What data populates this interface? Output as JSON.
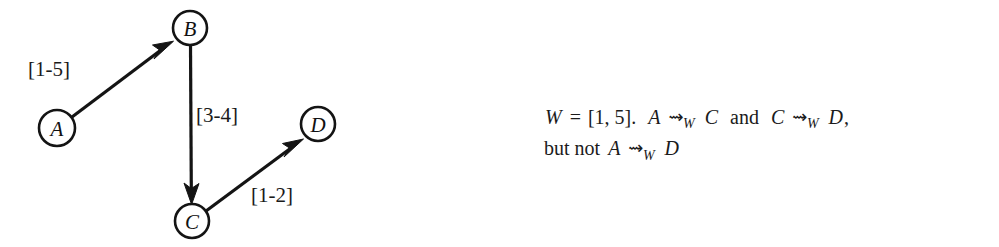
{
  "figure": {
    "background_color": "#ffffff",
    "ink_color": "#141414",
    "graph": {
      "nodes": [
        {
          "id": "A",
          "label": "A",
          "cx": 57,
          "cy": 128,
          "r": 18
        },
        {
          "id": "B",
          "label": "B",
          "cx": 190,
          "cy": 28,
          "r": 17
        },
        {
          "id": "C",
          "label": "C",
          "cx": 192,
          "cy": 221,
          "r": 17
        },
        {
          "id": "D",
          "label": "D",
          "cx": 318,
          "cy": 124,
          "r": 17
        }
      ],
      "edges": [
        {
          "id": "A-B",
          "from": "A",
          "to": "B",
          "label": "[1-5]",
          "label_x": 28,
          "label_y": 57
        },
        {
          "id": "B-C",
          "from": "B",
          "to": "C",
          "label": "[3-4]",
          "label_x": 193,
          "label_y": 103
        },
        {
          "id": "C-D",
          "from": "C",
          "to": "D",
          "label": "[1-2]",
          "label_x": 250,
          "label_y": 183
        }
      ]
    },
    "caption": {
      "line1": {
        "w_var": "W",
        "equals": "=",
        "interval": "[1, 5].",
        "a_var": "A",
        "squiggle1": "⇝",
        "sub1": "W",
        "c_var": "C",
        "and_word": "and",
        "c_var2": "C",
        "squiggle2": "⇝",
        "sub2": "W",
        "d_var": "D",
        "comma": ","
      },
      "line2": {
        "but_not": "but not",
        "a_var": "A",
        "squiggle": "⇝",
        "sub": "W",
        "d_var": "D"
      }
    }
  }
}
